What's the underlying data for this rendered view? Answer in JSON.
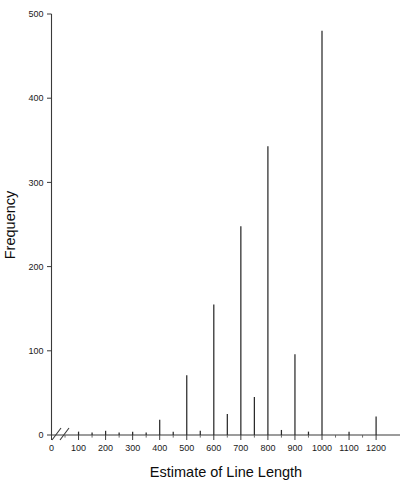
{
  "chart_data": {
    "type": "bar",
    "title": "",
    "xlabel": "Estimate of Line Length",
    "ylabel": "Frequency",
    "xlim": [
      0,
      1250
    ],
    "ylim": [
      0,
      500
    ],
    "grid": false,
    "legend": null,
    "axis_break": "x-axis break between 0 and 100",
    "x_major_ticks": [
      0,
      100,
      200,
      300,
      400,
      500,
      600,
      700,
      800,
      900,
      1000,
      1100,
      1200
    ],
    "x_minor_ticks": [
      50,
      150,
      250,
      350,
      450,
      550,
      650,
      750,
      850,
      950,
      1050,
      1150
    ],
    "y_major_ticks": [
      0,
      100,
      200,
      300,
      400,
      500
    ],
    "x_tick_labels": [
      "0",
      "100",
      "200",
      "300",
      "400",
      "500",
      "600",
      "700",
      "800",
      "900",
      "1000",
      "1100",
      "1200"
    ],
    "y_tick_labels": [
      "0",
      "100",
      "200",
      "300",
      "400",
      "500"
    ],
    "categories": [
      100,
      150,
      200,
      250,
      300,
      350,
      400,
      450,
      500,
      550,
      600,
      650,
      700,
      750,
      800,
      850,
      900,
      950,
      1000,
      1100,
      1200
    ],
    "values": [
      4,
      3,
      5,
      3,
      4,
      3,
      18,
      4,
      71,
      5,
      155,
      25,
      248,
      45,
      343,
      6,
      96,
      4,
      480,
      4,
      22
    ]
  },
  "axes": {
    "x_title": "Estimate of Line Length",
    "y_title": "Frequency"
  }
}
